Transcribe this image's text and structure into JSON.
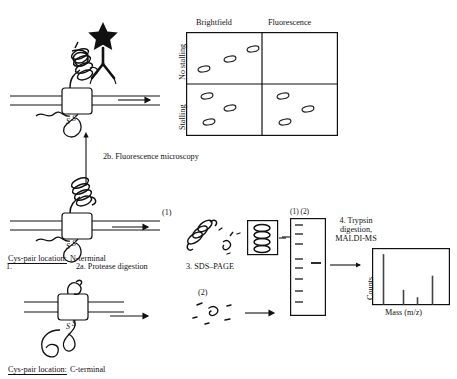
{
  "figure": {
    "type": "scientific-workflow-diagram",
    "caption_labels": {
      "step1": "1.",
      "step2a": "2a. Protease digestion",
      "step2b": "2b. Fluorescence microscopy",
      "step3": "3. SDS–PAGE",
      "step4": "4. Trypsin digestion, MALDI-MS",
      "step4_line1": "4. Trypsin",
      "step4_line2": "digestion,",
      "step4_line3": "MALDI-MS"
    },
    "construct_labels": {
      "n_terminal_prefix": "Cys-pair location:",
      "n_terminal_value": "N-terminal",
      "c_terminal_prefix": "Cys-pair location:",
      "c_terminal_value": "C-terminal"
    },
    "fragment_tags": {
      "one": "(1)",
      "two": "(2)",
      "gel_lanes": "(1) (2)"
    }
  },
  "microscopy_panel": {
    "column_headers": [
      "Brightfield",
      "Fluorescence"
    ],
    "row_headers": [
      "No stalling",
      "Stalling"
    ],
    "cells": [
      {
        "row": "No stalling",
        "col": "Brightfield",
        "spots": 3,
        "spot_positions": [
          [
            18,
            34
          ],
          [
            44,
            24
          ],
          [
            70,
            14
          ]
        ]
      },
      {
        "row": "No stalling",
        "col": "Fluorescence",
        "spots": 0,
        "spot_positions": []
      },
      {
        "row": "Stalling",
        "col": "Brightfield",
        "spots": 3,
        "spot_positions": [
          [
            20,
            10
          ],
          [
            42,
            22
          ],
          [
            22,
            38
          ]
        ]
      },
      {
        "row": "Stalling",
        "col": "Fluorescence",
        "spots": 3,
        "spot_positions": [
          [
            20,
            10
          ],
          [
            46,
            24
          ],
          [
            24,
            38
          ]
        ]
      }
    ]
  },
  "chart_data": {
    "type": "bar",
    "title": "",
    "xlabel": "Mass (m/z)",
    "ylabel": "Counts",
    "categories": [
      "p1",
      "p2",
      "p3",
      "p4"
    ],
    "values": [
      96,
      28,
      14,
      55
    ],
    "ylim": [
      0,
      100
    ],
    "grid": false,
    "legend": "none",
    "x_positions": [
      0.14,
      0.4,
      0.58,
      0.78
    ]
  },
  "gel": {
    "lane_label": "(1) (2)",
    "ladder_bands": [
      6,
      15,
      24,
      40,
      49,
      60,
      72,
      83
    ],
    "sample_bands": [
      44
    ]
  },
  "colors": {
    "ink": "#111111",
    "line": "#1a1a1a",
    "paper": "#ffffff",
    "fill": "#ffffff"
  }
}
